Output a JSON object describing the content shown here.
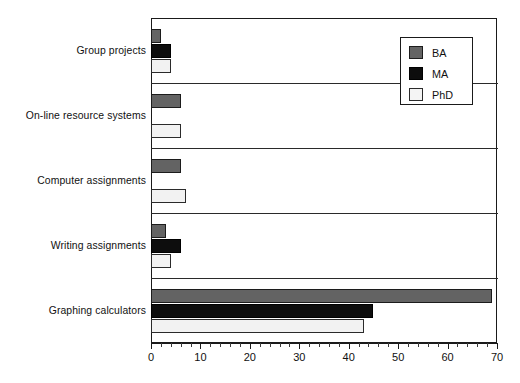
{
  "chart_data": {
    "type": "bar",
    "orientation": "horizontal",
    "title": "",
    "xlabel": "",
    "ylabel": "",
    "xlim": [
      0,
      70
    ],
    "xticks": [
      0,
      10,
      20,
      30,
      40,
      50,
      60,
      70
    ],
    "xtick_labels": [
      "0",
      "10",
      "20",
      "30",
      "40",
      "50",
      "60",
      "70"
    ],
    "minor_tick_step": 2,
    "grid": false,
    "legend_position": "top-right",
    "categories": [
      "Group projects",
      "On-line resource systems",
      "Computer assignments",
      "Writing assignments",
      "Graphing calculators"
    ],
    "series": [
      {
        "name": "BA",
        "color": "#636363",
        "values": [
          2,
          6,
          6,
          3,
          69
        ]
      },
      {
        "name": "MA",
        "color": "#0d0d0d",
        "values": [
          4,
          0,
          0,
          6,
          45
        ]
      },
      {
        "name": "PhD",
        "color": "#f2f2f2",
        "values": [
          4,
          6,
          7,
          4,
          43
        ]
      }
    ]
  },
  "legend": {
    "entries": [
      {
        "label": "BA",
        "swatch": "ba"
      },
      {
        "label": "MA",
        "swatch": "ma"
      },
      {
        "label": "PhD",
        "swatch": "phd"
      }
    ]
  },
  "axis": {
    "ticks": [
      {
        "value": 0,
        "label": "0"
      },
      {
        "value": 10,
        "label": "10"
      },
      {
        "value": 20,
        "label": "20"
      },
      {
        "value": 30,
        "label": "30"
      },
      {
        "value": 40,
        "label": "40"
      },
      {
        "value": 50,
        "label": "50"
      },
      {
        "value": 60,
        "label": "60"
      },
      {
        "value": 70,
        "label": "70"
      }
    ]
  }
}
